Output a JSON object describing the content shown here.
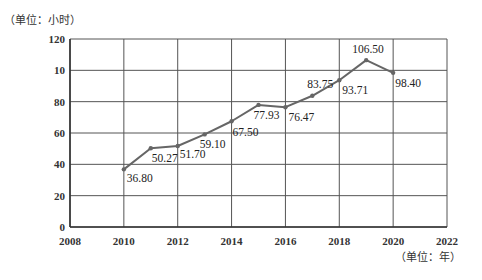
{
  "chart_data": {
    "type": "line",
    "title": "",
    "ylabel": "（单位：小时）",
    "xlabel": "（单位：年）",
    "x": [
      2010,
      2011,
      2012,
      2013,
      2014,
      2015,
      2016,
      2017,
      2018,
      2019,
      2020
    ],
    "series": [
      {
        "name": "",
        "values": [
          36.8,
          50.27,
          51.7,
          59.1,
          67.5,
          77.93,
          76.47,
          83.75,
          93.71,
          106.5,
          98.4
        ],
        "labels": [
          "36.80",
          "50.27",
          "51.70",
          "59.10",
          "67.50",
          "77.93",
          "76.47",
          "83.75",
          "93.71",
          "106.50",
          "98.40"
        ]
      }
    ],
    "xlim": [
      2008,
      2022
    ],
    "ylim": [
      0,
      120
    ],
    "xticks": [
      2008,
      2010,
      2012,
      2014,
      2016,
      2018,
      2020,
      2022
    ],
    "xtick_labels": [
      "2008",
      "2010",
      "2012",
      "2014",
      "2016",
      "2018",
      "2020",
      "2022"
    ],
    "yticks": [
      0,
      20,
      40,
      60,
      80,
      100,
      120
    ],
    "ytick_labels": [
      "0",
      "20",
      "40",
      "60",
      "80",
      "10",
      "120"
    ],
    "grid": true,
    "legend": "none",
    "colors": {
      "line": "#666666",
      "grid": "#555555",
      "axis": "#333333"
    }
  }
}
